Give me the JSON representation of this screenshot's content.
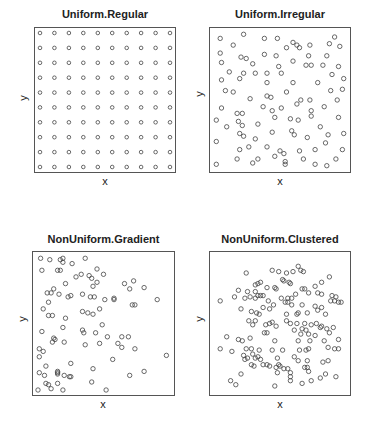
{
  "chart_data": [
    {
      "type": "scatter",
      "title": "Uniform.Regular",
      "xlabel": "x",
      "ylabel": "y",
      "xlim": [
        0,
        1
      ],
      "ylim": [
        0,
        1
      ],
      "grid": false,
      "marker": "open-circle",
      "frame": {
        "left": 34,
        "top": 27,
        "right": 176,
        "bottom": 173
      },
      "description": "10 x 10 regular lattice of points",
      "points": "grid10x10"
    },
    {
      "type": "scatter",
      "title": "Uniform.Irregular",
      "xlabel": "x",
      "ylabel": "y",
      "xlim": [
        0,
        1
      ],
      "ylim": [
        0,
        1
      ],
      "grid": false,
      "marker": "open-circle",
      "frame": {
        "left": 209,
        "top": 27,
        "right": 351,
        "bottom": 173
      },
      "points": [
        [
          0.04,
          0.96
        ],
        [
          0.22,
          0.99
        ],
        [
          0.38,
          0.96
        ],
        [
          0.48,
          0.96
        ],
        [
          0.6,
          0.93
        ],
        [
          0.63,
          0.91
        ],
        [
          0.65,
          0.89
        ],
        [
          0.55,
          0.89
        ],
        [
          0.73,
          0.91
        ],
        [
          0.88,
          0.92
        ],
        [
          0.92,
          0.97
        ],
        [
          0.96,
          0.9
        ],
        [
          0.14,
          0.91
        ],
        [
          0.04,
          0.85
        ],
        [
          0.38,
          0.84
        ],
        [
          0.47,
          0.83
        ],
        [
          0.2,
          0.82
        ],
        [
          0.24,
          0.81
        ],
        [
          0.6,
          0.79
        ],
        [
          0.72,
          0.83
        ],
        [
          0.86,
          0.83
        ],
        [
          0.05,
          0.78
        ],
        [
          0.29,
          0.77
        ],
        [
          0.49,
          0.75
        ],
        [
          0.7,
          0.76
        ],
        [
          0.74,
          0.76
        ],
        [
          0.83,
          0.76
        ],
        [
          0.95,
          0.75
        ],
        [
          0.11,
          0.71
        ],
        [
          0.22,
          0.7
        ],
        [
          0.31,
          0.7
        ],
        [
          0.4,
          0.7
        ],
        [
          0.51,
          0.7
        ],
        [
          0.9,
          0.69
        ],
        [
          0.05,
          0.65
        ],
        [
          0.19,
          0.66
        ],
        [
          0.4,
          0.63
        ],
        [
          0.6,
          0.63
        ],
        [
          0.79,
          0.63
        ],
        [
          0.99,
          0.66
        ],
        [
          0.08,
          0.57
        ],
        [
          0.14,
          0.56
        ],
        [
          0.4,
          0.53
        ],
        [
          0.43,
          0.52
        ],
        [
          0.55,
          0.56
        ],
        [
          0.89,
          0.57
        ],
        [
          0.98,
          0.58
        ],
        [
          0.27,
          0.51
        ],
        [
          0.66,
          0.5
        ],
        [
          0.73,
          0.5
        ],
        [
          0.63,
          0.47
        ],
        [
          0.94,
          0.5
        ],
        [
          0.05,
          0.44
        ],
        [
          0.37,
          0.45
        ],
        [
          0.44,
          0.42
        ],
        [
          0.51,
          0.44
        ],
        [
          0.74,
          0.42
        ],
        [
          0.84,
          0.45
        ],
        [
          0.17,
          0.4
        ],
        [
          0.21,
          0.4
        ],
        [
          0.46,
          0.37
        ],
        [
          0.58,
          0.36
        ],
        [
          0.64,
          0.35
        ],
        [
          0.74,
          0.38
        ],
        [
          0.95,
          0.37
        ],
        [
          0.01,
          0.35
        ],
        [
          0.18,
          0.34
        ],
        [
          0.21,
          0.31
        ],
        [
          0.33,
          0.32
        ],
        [
          0.09,
          0.3
        ],
        [
          0.81,
          0.3
        ],
        [
          0.19,
          0.25
        ],
        [
          0.22,
          0.23
        ],
        [
          0.44,
          0.26
        ],
        [
          0.59,
          0.27
        ],
        [
          0.61,
          0.24
        ],
        [
          0.71,
          0.22
        ],
        [
          0.87,
          0.24
        ],
        [
          0.99,
          0.25
        ],
        [
          0.01,
          0.19
        ],
        [
          0.31,
          0.21
        ],
        [
          0.85,
          0.18
        ],
        [
          0.19,
          0.13
        ],
        [
          0.26,
          0.15
        ],
        [
          0.4,
          0.15
        ],
        [
          0.5,
          0.12
        ],
        [
          0.53,
          0.1
        ],
        [
          0.65,
          0.12
        ],
        [
          0.77,
          0.13
        ],
        [
          0.98,
          0.13
        ],
        [
          0.17,
          0.06
        ],
        [
          0.33,
          0.06
        ],
        [
          0.46,
          0.08
        ],
        [
          0.54,
          0.04
        ],
        [
          0.68,
          0.06
        ],
        [
          0.93,
          0.06
        ],
        [
          0.01,
          0.02
        ],
        [
          0.29,
          0.03
        ],
        [
          0.54,
          0.02
        ],
        [
          0.77,
          0.02
        ],
        [
          0.86,
          0.01
        ]
      ]
    },
    {
      "type": "scatter",
      "title": "NonUniform.Gradient",
      "xlabel": "x",
      "ylabel": "y",
      "xlim": [
        0,
        1
      ],
      "ylim": [
        0,
        1
      ],
      "grid": false,
      "marker": "open-circle",
      "frame": {
        "left": 32,
        "top": 251,
        "right": 175,
        "bottom": 396
      },
      "points": [
        [
          0.02,
          0.99
        ],
        [
          0.09,
          0.98
        ],
        [
          0.17,
          0.98
        ],
        [
          0.19,
          0.96
        ],
        [
          0.19,
          0.99
        ],
        [
          0.36,
          0.99
        ],
        [
          0.26,
          0.95
        ],
        [
          0.03,
          0.9
        ],
        [
          0.15,
          0.9
        ],
        [
          0.17,
          0.9
        ],
        [
          0.45,
          0.91
        ],
        [
          0.33,
          0.87
        ],
        [
          0.29,
          0.85
        ],
        [
          0.39,
          0.86
        ],
        [
          0.41,
          0.84
        ],
        [
          0.5,
          0.87
        ],
        [
          0.21,
          0.8
        ],
        [
          0.45,
          0.81
        ],
        [
          0.42,
          0.78
        ],
        [
          0.66,
          0.8
        ],
        [
          0.73,
          0.82
        ],
        [
          0.81,
          0.77
        ],
        [
          0.12,
          0.76
        ],
        [
          0.07,
          0.73
        ],
        [
          0.1,
          0.73
        ],
        [
          0.16,
          0.72
        ],
        [
          0.23,
          0.7
        ],
        [
          0.25,
          0.71
        ],
        [
          0.34,
          0.72
        ],
        [
          0.4,
          0.7
        ],
        [
          0.43,
          0.7
        ],
        [
          0.51,
          0.68
        ],
        [
          0.58,
          0.68
        ],
        [
          0.58,
          0.69
        ],
        [
          0.7,
          0.76
        ],
        [
          0.72,
          0.64
        ],
        [
          0.74,
          0.64
        ],
        [
          0.91,
          0.68
        ],
        [
          0.08,
          0.66
        ],
        [
          0.04,
          0.61
        ],
        [
          0.08,
          0.56
        ],
        [
          0.11,
          0.56
        ],
        [
          0.21,
          0.54
        ],
        [
          0.34,
          0.59
        ],
        [
          0.38,
          0.58
        ],
        [
          0.42,
          0.57
        ],
        [
          0.47,
          0.61
        ],
        [
          0.49,
          0.49
        ],
        [
          0.19,
          0.47
        ],
        [
          0.34,
          0.45
        ],
        [
          0.35,
          0.43
        ],
        [
          0.44,
          0.43
        ],
        [
          0.53,
          0.4
        ],
        [
          0.03,
          0.44
        ],
        [
          0.12,
          0.39
        ],
        [
          0.11,
          0.36
        ],
        [
          0.13,
          0.38
        ],
        [
          0.2,
          0.36
        ],
        [
          0.36,
          0.34
        ],
        [
          0.47,
          0.35
        ],
        [
          0.64,
          0.4
        ],
        [
          0.69,
          0.4
        ],
        [
          0.61,
          0.35
        ],
        [
          0.64,
          0.32
        ],
        [
          0.74,
          0.31
        ],
        [
          0.57,
          0.23
        ],
        [
          0.98,
          0.26
        ],
        [
          0.01,
          0.31
        ],
        [
          0.04,
          0.29
        ],
        [
          0.01,
          0.25
        ],
        [
          0.06,
          0.18
        ],
        [
          0.25,
          0.2
        ],
        [
          0.42,
          0.16
        ],
        [
          0.01,
          0.13
        ],
        [
          0.05,
          0.11
        ],
        [
          0.15,
          0.14
        ],
        [
          0.15,
          0.13
        ],
        [
          0.15,
          0.12
        ],
        [
          0.2,
          0.11
        ],
        [
          0.24,
          0.1
        ],
        [
          0.25,
          0.1
        ],
        [
          0.7,
          0.11
        ],
        [
          0.81,
          0.14
        ],
        [
          0.06,
          0.05
        ],
        [
          0.08,
          0.04
        ],
        [
          0.15,
          0.05
        ],
        [
          0.41,
          0.06
        ],
        [
          0.0,
          0.0
        ],
        [
          0.1,
          0.01
        ],
        [
          0.19,
          0.0
        ],
        [
          0.52,
          0.0
        ]
      ]
    },
    {
      "type": "scatter",
      "title": "NonUniform.Clustered",
      "xlabel": "x",
      "ylabel": "y",
      "xlim": [
        0,
        1
      ],
      "ylim": [
        0,
        1
      ],
      "grid": false,
      "marker": "open-circle",
      "frame": {
        "left": 209,
        "top": 251,
        "right": 351,
        "bottom": 396
      },
      "points": [
        [
          0.64,
          0.93
        ],
        [
          0.6,
          0.89
        ],
        [
          0.66,
          0.9
        ],
        [
          0.68,
          0.89
        ],
        [
          0.44,
          0.9
        ],
        [
          0.49,
          0.89
        ],
        [
          0.55,
          0.88
        ],
        [
          0.24,
          0.88
        ],
        [
          0.88,
          0.85
        ],
        [
          0.52,
          0.83
        ],
        [
          0.53,
          0.82
        ],
        [
          0.57,
          0.81
        ],
        [
          0.58,
          0.8
        ],
        [
          0.35,
          0.81
        ],
        [
          0.33,
          0.8
        ],
        [
          0.31,
          0.79
        ],
        [
          0.4,
          0.77
        ],
        [
          0.46,
          0.77
        ],
        [
          0.47,
          0.76
        ],
        [
          0.82,
          0.81
        ],
        [
          0.77,
          0.78
        ],
        [
          0.67,
          0.76
        ],
        [
          0.69,
          0.76
        ],
        [
          0.18,
          0.75
        ],
        [
          0.25,
          0.74
        ],
        [
          0.31,
          0.74
        ],
        [
          0.33,
          0.71
        ],
        [
          0.37,
          0.71
        ],
        [
          0.35,
          0.71
        ],
        [
          0.27,
          0.7
        ],
        [
          0.23,
          0.69
        ],
        [
          0.31,
          0.69
        ],
        [
          0.51,
          0.69
        ],
        [
          0.56,
          0.69
        ],
        [
          0.62,
          0.72
        ],
        [
          0.59,
          0.69
        ],
        [
          0.72,
          0.73
        ],
        [
          0.79,
          0.73
        ],
        [
          0.82,
          0.72
        ],
        [
          0.9,
          0.71
        ],
        [
          0.93,
          0.7
        ],
        [
          0.15,
          0.7
        ],
        [
          0.04,
          0.67
        ],
        [
          0.41,
          0.67
        ],
        [
          0.45,
          0.64
        ],
        [
          0.54,
          0.66
        ],
        [
          0.56,
          0.66
        ],
        [
          0.59,
          0.64
        ],
        [
          0.67,
          0.64
        ],
        [
          0.89,
          0.67
        ],
        [
          0.92,
          0.67
        ],
        [
          0.95,
          0.66
        ],
        [
          0.97,
          0.66
        ],
        [
          0.2,
          0.61
        ],
        [
          0.37,
          0.62
        ],
        [
          0.42,
          0.61
        ],
        [
          0.77,
          0.63
        ],
        [
          0.82,
          0.62
        ],
        [
          0.79,
          0.6
        ],
        [
          0.28,
          0.59
        ],
        [
          0.32,
          0.58
        ],
        [
          0.34,
          0.57
        ],
        [
          0.55,
          0.57
        ],
        [
          0.63,
          0.57
        ],
        [
          0.64,
          0.58
        ],
        [
          0.71,
          0.58
        ],
        [
          0.85,
          0.57
        ],
        [
          0.26,
          0.52
        ],
        [
          0.31,
          0.52
        ],
        [
          0.44,
          0.51
        ],
        [
          0.55,
          0.52
        ],
        [
          0.29,
          0.49
        ],
        [
          0.39,
          0.49
        ],
        [
          0.42,
          0.5
        ],
        [
          0.47,
          0.48
        ],
        [
          0.58,
          0.5
        ],
        [
          0.63,
          0.5
        ],
        [
          0.69,
          0.5
        ],
        [
          0.74,
          0.49
        ],
        [
          0.78,
          0.5
        ],
        [
          0.81,
          0.47
        ],
        [
          0.82,
          0.48
        ],
        [
          0.61,
          0.45
        ],
        [
          0.67,
          0.46
        ],
        [
          0.7,
          0.45
        ],
        [
          0.4,
          0.43
        ],
        [
          0.38,
          0.43
        ],
        [
          0.66,
          0.42
        ],
        [
          0.72,
          0.42
        ],
        [
          0.77,
          0.41
        ],
        [
          0.86,
          0.46
        ],
        [
          0.88,
          0.43
        ],
        [
          0.91,
          0.47
        ],
        [
          0.09,
          0.4
        ],
        [
          0.18,
          0.38
        ],
        [
          0.21,
          0.37
        ],
        [
          0.27,
          0.39
        ],
        [
          0.46,
          0.37
        ],
        [
          0.64,
          0.37
        ],
        [
          0.73,
          0.37
        ],
        [
          0.84,
          0.37
        ],
        [
          0.95,
          0.38
        ],
        [
          0.04,
          0.31
        ],
        [
          0.13,
          0.29
        ],
        [
          0.24,
          0.31
        ],
        [
          0.28,
          0.31
        ],
        [
          0.29,
          0.27
        ],
        [
          0.31,
          0.24
        ],
        [
          0.34,
          0.3
        ],
        [
          0.44,
          0.3
        ],
        [
          0.52,
          0.3
        ],
        [
          0.65,
          0.3
        ],
        [
          0.7,
          0.3
        ],
        [
          0.72,
          0.31
        ],
        [
          0.87,
          0.32
        ],
        [
          0.92,
          0.31
        ],
        [
          0.95,
          0.31
        ],
        [
          0.22,
          0.26
        ],
        [
          0.25,
          0.24
        ],
        [
          0.33,
          0.25
        ],
        [
          0.35,
          0.23
        ],
        [
          0.48,
          0.24
        ],
        [
          0.61,
          0.25
        ],
        [
          0.64,
          0.22
        ],
        [
          0.71,
          0.22
        ],
        [
          0.83,
          0.21
        ],
        [
          0.87,
          0.22
        ],
        [
          0.23,
          0.23
        ],
        [
          0.28,
          0.19
        ],
        [
          0.3,
          0.18
        ],
        [
          0.42,
          0.18
        ],
        [
          0.47,
          0.17
        ],
        [
          0.49,
          0.19
        ],
        [
          0.5,
          0.18
        ],
        [
          0.53,
          0.16
        ],
        [
          0.69,
          0.17
        ],
        [
          0.71,
          0.17
        ],
        [
          0.2,
          0.12
        ],
        [
          0.37,
          0.19
        ],
        [
          0.4,
          0.19
        ],
        [
          0.48,
          0.13
        ],
        [
          0.56,
          0.16
        ],
        [
          0.58,
          0.13
        ],
        [
          0.58,
          0.1
        ],
        [
          0.72,
          0.14
        ],
        [
          0.85,
          0.12
        ],
        [
          0.81,
          0.09
        ],
        [
          0.74,
          0.07
        ],
        [
          0.93,
          0.1
        ],
        [
          0.16,
          0.04
        ],
        [
          0.46,
          0.03
        ],
        [
          0.58,
          0.07
        ],
        [
          0.67,
          0.05
        ],
        [
          0.12,
          0.07
        ]
      ]
    }
  ],
  "panels": [
    {
      "title": "Uniform.Regular",
      "xlabel": "x",
      "ylabel": "y"
    },
    {
      "title": "Uniform.Irregular",
      "xlabel": "x",
      "ylabel": "y"
    },
    {
      "title": "NonUniform.Gradient",
      "xlabel": "x",
      "ylabel": "y"
    },
    {
      "title": "NonUniform.Clustered",
      "xlabel": "x",
      "ylabel": "y"
    }
  ]
}
